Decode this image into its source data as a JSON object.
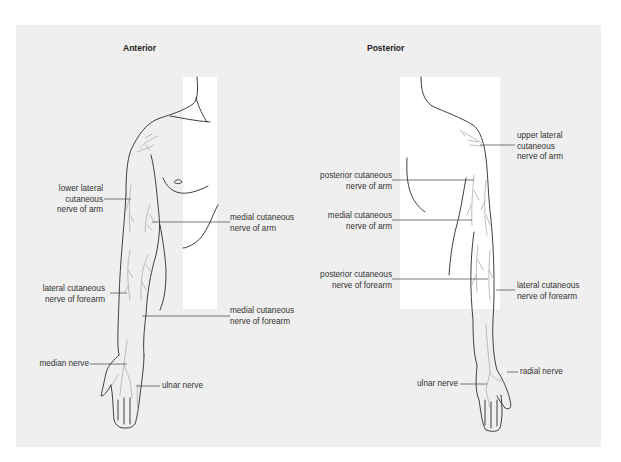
{
  "titles": {
    "anterior": "Anterior",
    "posterior": "Posterior"
  },
  "anterior_labels": {
    "lower_lateral": [
      "lower lateral",
      "cutaneous",
      "nerve of arm"
    ],
    "medial_arm": [
      "medial cutaneous",
      "nerve of arm"
    ],
    "lateral_forearm": [
      "lateral cutaneous",
      "nerve of forearm"
    ],
    "medial_forearm": [
      "medial cutaneous",
      "nerve of forearm"
    ],
    "median": "median nerve",
    "ulnar": "ulnar nerve"
  },
  "posterior_labels": {
    "upper_lateral": [
      "upper lateral",
      "cutaneous",
      "nerve of arm"
    ],
    "posterior_arm": [
      "posterior cutaneous",
      "nerve of arm"
    ],
    "medial_arm": [
      "medial cutaneous",
      "nerve of arm"
    ],
    "posterior_forearm": [
      "posterior cutaneous",
      "nerve of forearm"
    ],
    "lateral_forearm": [
      "lateral cutaneous",
      "nerve of forearm"
    ],
    "radial": "radial nerve",
    "ulnar": "ulnar nerve"
  },
  "colors": {
    "panel": "#efefef",
    "outline": "#2a2a2a",
    "nerve": "#b5b5b5",
    "leader": "#444444"
  }
}
